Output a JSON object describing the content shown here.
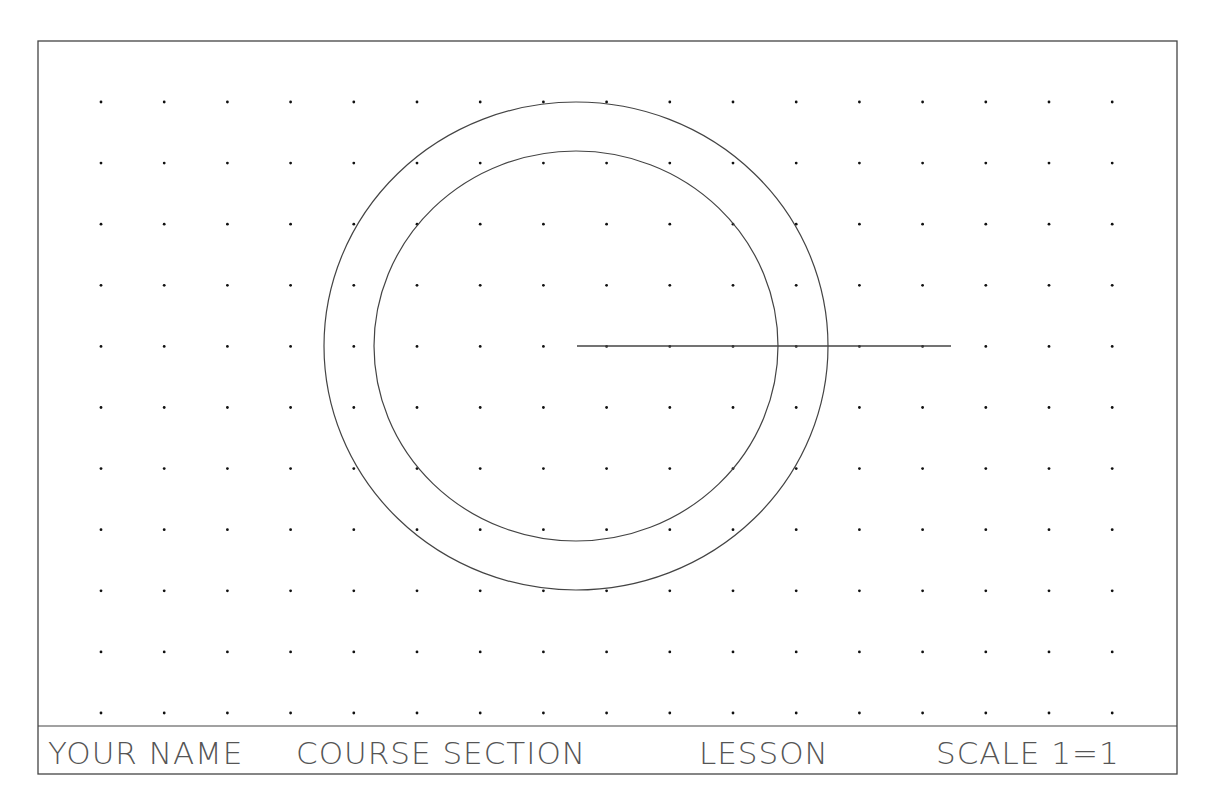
{
  "sheet": {
    "border": {
      "x": 38,
      "y": 41,
      "width": 1139,
      "height": 733
    },
    "divider_y": 726,
    "line_color": "#444444",
    "dot_color": "#111111"
  },
  "grid": {
    "start_x": 101,
    "start_y": 102,
    "step_x": 63.2,
    "step_y": 61.1,
    "cols": 17,
    "rows": 11
  },
  "geometry": {
    "outer_circle": {
      "cx": 576,
      "cy": 346,
      "rx": 252,
      "ry": 244
    },
    "inner_circle": {
      "cx": 576,
      "cy": 346,
      "rx": 202,
      "ry": 195
    },
    "line": {
      "x1": 577,
      "y1": 346,
      "x2": 951,
      "y2": 346
    }
  },
  "title_block": {
    "your_name": "YOUR NAME",
    "course_section": "COURSE SECTION",
    "lesson": "LESSON",
    "scale": "SCALE 1=1"
  }
}
